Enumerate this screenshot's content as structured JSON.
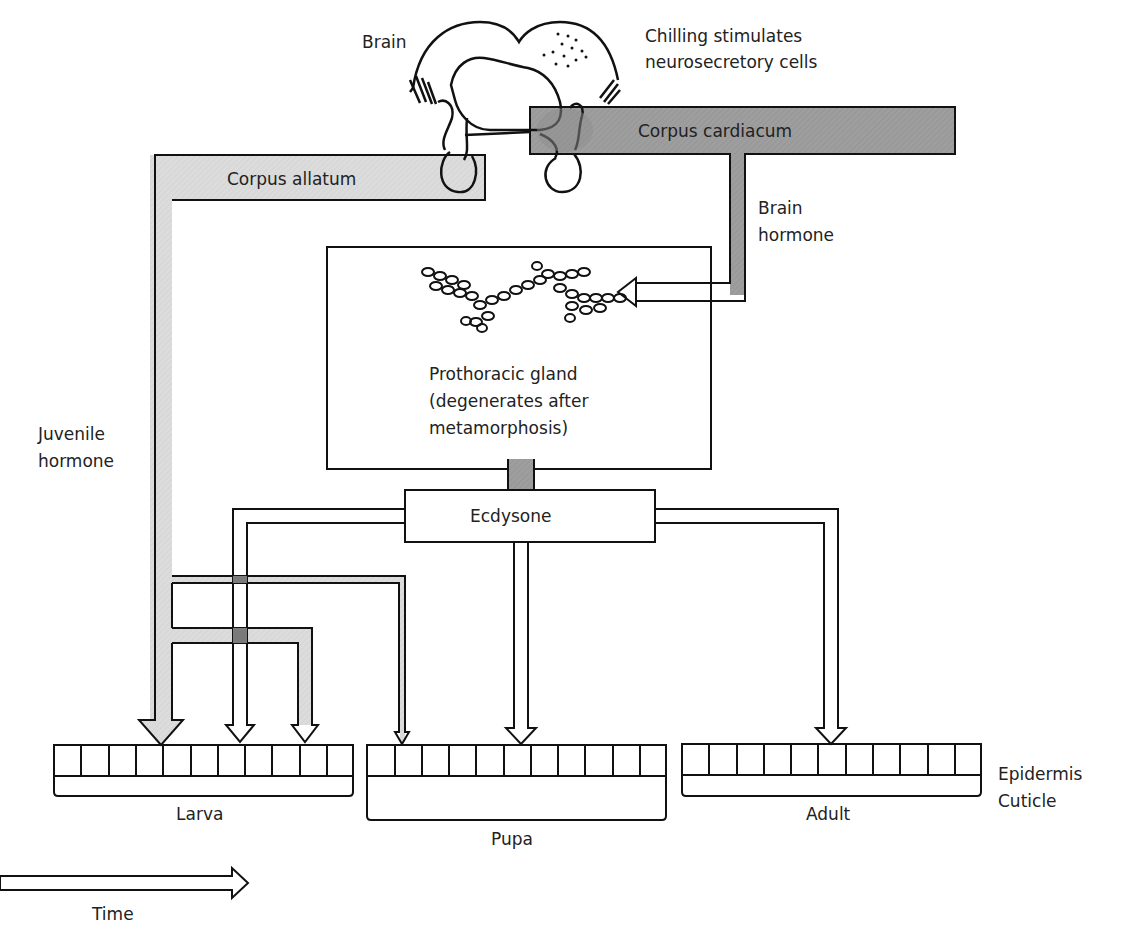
{
  "colors": {
    "background": "#ffffff",
    "light_hormone": "#d9d9d9",
    "dark_hormone": "#999999",
    "stroke": "#111111",
    "text": "#222222"
  },
  "labels": {
    "brain": "Brain",
    "chilling_line1": "Chilling stimulates",
    "chilling_line2": "neurosecretory cells",
    "corpus_cardiacum": "Corpus cardiacum",
    "corpus_allatum": "Corpus allatum",
    "brain_hormone_line1": "Brain",
    "brain_hormone_line2": "hormone",
    "prothoracic_line1": "Prothoracic gland",
    "prothoracic_line2": "(degenerates after",
    "prothoracic_line3": "metamorphosis)",
    "juvenile_line1": "Juvenile",
    "juvenile_line2": "hormone",
    "ecdysone": "Ecdysone",
    "epidermis": "Epidermis",
    "cuticle": "Cuticle",
    "larva": "Larva",
    "pupa": "Pupa",
    "adult": "Adult",
    "time": "Time"
  },
  "stages": [
    {
      "name": "Larva",
      "cells": 11,
      "x": 54,
      "width": 299
    },
    {
      "name": "Pupa",
      "cells": 11,
      "x": 367,
      "width": 299
    },
    {
      "name": "Adult",
      "cells": 11,
      "x": 682,
      "width": 299
    }
  ],
  "icons": {
    "brain": "brain-outline-icon",
    "gland": "prothoracic-gland-cells-icon",
    "time_arrow": "right-arrow-icon"
  }
}
